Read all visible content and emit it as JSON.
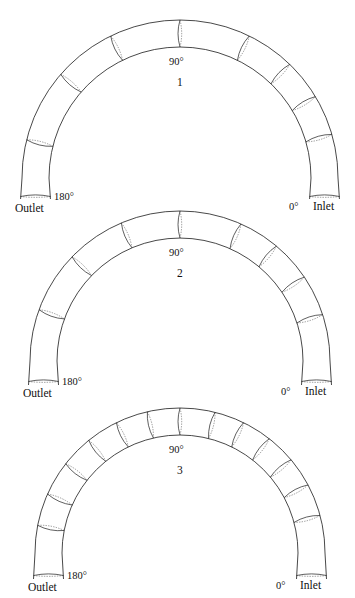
{
  "figure": {
    "arch_count": 3
  },
  "labels": {
    "inlet": "Inlet",
    "outlet": "Outlet",
    "deg0": "0°",
    "deg90": "90°",
    "deg180": "180°"
  },
  "arches": [
    {
      "id": "1",
      "name": "1",
      "top": 0,
      "cx": 180,
      "cy": 178,
      "r_outer": 158,
      "r_inner": 131,
      "tail": 22,
      "divider_angles": [
        16,
        31,
        46,
        64,
        90,
        116,
        139,
        166
      ],
      "end_caps": [
        0,
        180
      ]
    },
    {
      "id": "2",
      "name": "2",
      "top": 199,
      "cx": 180,
      "cy": 162,
      "r_outer": 150,
      "r_inner": 123,
      "tail": 24,
      "divider_angles": [
        18,
        34,
        50,
        66,
        90,
        113,
        136,
        160
      ],
      "end_caps": [
        0,
        180
      ]
    },
    {
      "id": "3",
      "name": "3",
      "top": 398,
      "cx": 180,
      "cy": 155,
      "r_outer": 145,
      "r_inner": 118,
      "tail": 26,
      "divider_angles": [
        15,
        28,
        40,
        52,
        64,
        76,
        90,
        103,
        116,
        129,
        142,
        156,
        169
      ],
      "end_caps": [
        0,
        180
      ]
    }
  ],
  "chart_data": {
    "type": "diagram",
    "title": "",
    "series": [
      {
        "name": "1",
        "segment_dividers": 8,
        "angles": [
          16,
          31,
          46,
          64,
          90,
          116,
          139,
          166
        ]
      },
      {
        "name": "2",
        "segment_dividers": 8,
        "angles": [
          18,
          34,
          50,
          66,
          90,
          113,
          136,
          160
        ]
      },
      {
        "name": "3",
        "segment_dividers": 13,
        "angles": [
          15,
          28,
          40,
          52,
          64,
          76,
          90,
          103,
          116,
          129,
          142,
          156,
          169
        ]
      }
    ],
    "annotations": [
      "0°",
      "90°",
      "180°",
      "Inlet",
      "Outlet"
    ]
  }
}
